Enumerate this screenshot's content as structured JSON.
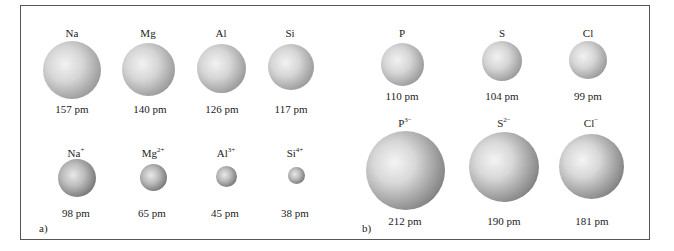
{
  "panels": [
    {
      "label": "a)",
      "atoms": [
        {
          "symbol": "Na",
          "charge": "",
          "radius": "157 pm"
        },
        {
          "symbol": "Mg",
          "charge": "",
          "radius": "140 pm"
        },
        {
          "symbol": "Al",
          "charge": "",
          "radius": "126 pm"
        },
        {
          "symbol": "Si",
          "charge": "",
          "radius": "117 pm"
        }
      ],
      "ions": [
        {
          "symbol": "Na",
          "charge": "+",
          "radius": "98 pm"
        },
        {
          "symbol": "Mg",
          "charge": "2+",
          "radius": "65 pm"
        },
        {
          "symbol": "Al",
          "charge": "3+",
          "radius": "45 pm"
        },
        {
          "symbol": "Si",
          "charge": "4+",
          "radius": "38 pm"
        }
      ]
    },
    {
      "label": "b)",
      "atoms": [
        {
          "symbol": "P",
          "charge": "",
          "radius": "110 pm"
        },
        {
          "symbol": "S",
          "charge": "",
          "radius": "104 pm"
        },
        {
          "symbol": "Cl",
          "charge": "",
          "radius": "99 pm"
        }
      ],
      "ions": [
        {
          "symbol": "P",
          "charge": "3−",
          "radius": "212 pm"
        },
        {
          "symbol": "S",
          "charge": "2−",
          "radius": "190 pm"
        },
        {
          "symbol": "Cl",
          "charge": "−",
          "radius": "181 pm"
        }
      ]
    }
  ]
}
